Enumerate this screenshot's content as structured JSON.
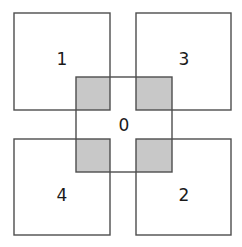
{
  "figure": {
    "background_color": "#ffffff",
    "outline_color": "#4d4d4d",
    "overlap_fill_color": "#c8c8c8",
    "label_color": "#1a1a1a"
  },
  "squares": [
    {
      "id": "square-1",
      "label": "1",
      "position": "top-left",
      "x": 14,
      "y": 13,
      "width": 96,
      "height": 97,
      "label_x": 62,
      "label_y": 60
    },
    {
      "id": "square-3",
      "label": "3",
      "position": "top-right",
      "x": 136,
      "y": 13,
      "width": 95,
      "height": 97,
      "label_x": 184,
      "label_y": 60
    },
    {
      "id": "square-4",
      "label": "4",
      "position": "bottom-left",
      "x": 14,
      "y": 139,
      "width": 96,
      "height": 96,
      "label_x": 62,
      "label_y": 196
    },
    {
      "id": "square-2",
      "label": "2",
      "position": "bottom-right",
      "x": 136,
      "y": 139,
      "width": 95,
      "height": 96,
      "label_x": 184,
      "label_y": 196
    },
    {
      "id": "square-0",
      "label": "0",
      "position": "center",
      "x": 76,
      "y": 77,
      "width": 96,
      "height": 95,
      "label_x": 124,
      "label_y": 126
    }
  ],
  "overlaps": [
    {
      "id": "overlap-0-1",
      "between": "0 and 1",
      "x": 76,
      "y": 77,
      "width": 34,
      "height": 33
    },
    {
      "id": "overlap-0-3",
      "between": "0 and 3",
      "x": 136,
      "y": 77,
      "width": 36,
      "height": 33
    },
    {
      "id": "overlap-0-4",
      "between": "0 and 4",
      "x": 76,
      "y": 139,
      "width": 34,
      "height": 33
    },
    {
      "id": "overlap-0-2",
      "between": "0 and 2",
      "x": 136,
      "y": 139,
      "width": 36,
      "height": 33
    }
  ]
}
